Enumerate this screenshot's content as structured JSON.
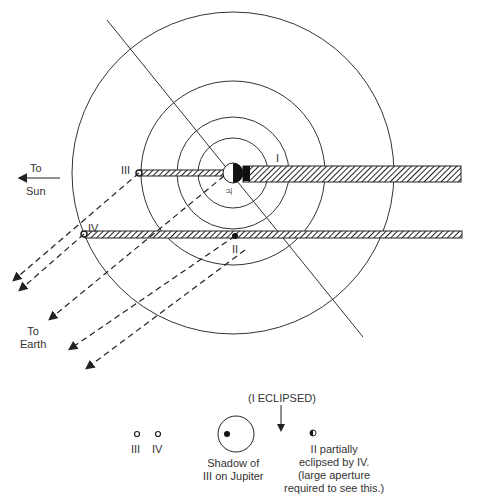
{
  "diagram": {
    "labels": {
      "to_sun": [
        "To",
        "Sun"
      ],
      "to_earth": [
        "To",
        "Earth"
      ],
      "moon_I": "I",
      "moon_II": "II",
      "moon_III": "III",
      "moon_IV": "IV",
      "jupiter_symbol": "♃"
    },
    "legend": {
      "eclipsed_note": "(I ECLIPSED)",
      "moon_III": "III",
      "moon_IV": "IV",
      "shadow_caption": [
        "Shadow of",
        "III on Jupiter"
      ],
      "partial_caption": [
        "II partially",
        "eclipsed by IV.",
        "(large aperture",
        "required to see this.)"
      ]
    },
    "colors": {
      "ink": "#222222",
      "background": "#ffffff"
    }
  }
}
